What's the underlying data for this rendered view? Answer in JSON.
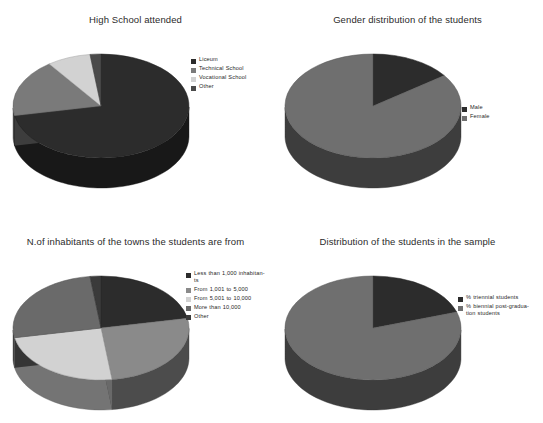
{
  "page": {
    "background_color": "#ffffff",
    "layout": "2x2 grid of 3-D pie charts"
  },
  "palette": {
    "slice_dark": "#2c2c2c",
    "slice_mid": "#7a7a7a",
    "slice_light": "#d2d2d2",
    "slice_midgray": "#9a9a9a",
    "slice_darkgray": "#4a4a4a",
    "text": "#1f1f1f"
  },
  "chart_data": [
    {
      "type": "pie",
      "title": "High School attended",
      "legend_position": "right",
      "categories": [
        "Liceum",
        "Technical School",
        "Vocational School",
        "Other"
      ],
      "values": [
        72,
        18,
        8,
        2
      ],
      "colors": [
        "#2c2c2c",
        "#7a7a7a",
        "#d2d2d2",
        "#4a4a4a"
      ],
      "xlabel": "",
      "ylabel": ""
    },
    {
      "type": "pie",
      "title": "Gender distribution of the students",
      "legend_position": "right",
      "categories": [
        "Male",
        "Female"
      ],
      "values": [
        15,
        85
      ],
      "colors": [
        "#2c2c2c",
        "#6f6f6f"
      ],
      "xlabel": "",
      "ylabel": ""
    },
    {
      "type": "pie",
      "title": "N.of inhabitants of the towns the students are from",
      "legend_position": "right",
      "categories": [
        "Less than 1,000 inhabitan-ts",
        "From 1,001 to 5,000",
        "From 5,001 to 10,000",
        "More than 10,000",
        "Other"
      ],
      "values": [
        22,
        26,
        24,
        26,
        2
      ],
      "colors": [
        "#2c2c2c",
        "#8a8a8a",
        "#d2d2d2",
        "#6a6a6a",
        "#3a3a3a"
      ],
      "xlabel": "",
      "ylabel": ""
    },
    {
      "type": "pie",
      "title": "Distribution of the students in the sample",
      "legend_position": "right",
      "categories": [
        "% triennial students",
        "% biennial post-gradua-tion students"
      ],
      "values": [
        20,
        80
      ],
      "colors": [
        "#2c2c2c",
        "#6f6f6f"
      ],
      "xlabel": "",
      "ylabel": ""
    }
  ]
}
